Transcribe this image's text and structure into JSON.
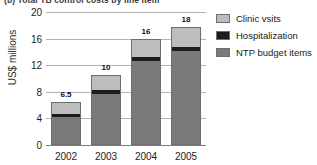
{
  "caption": "(b) Total TB control costs by line item",
  "chart_data": {
    "type": "bar",
    "stacked": true,
    "title": "(b) Total TB control costs by line item",
    "xlabel": "",
    "ylabel": "US$ millions",
    "ylim": [
      0,
      20
    ],
    "yticks": [
      0,
      4,
      8,
      12,
      16,
      20
    ],
    "ytick_labels": [
      "0",
      "4",
      "8",
      "12",
      "16",
      "20"
    ],
    "grid": "horizontal",
    "legend_position": "top-right",
    "categories": [
      "2002",
      "2003",
      "2004",
      "2005"
    ],
    "series": [
      {
        "name": "NTP budget items",
        "color": "#7a7a7a",
        "values": [
          4.2,
          7.7,
          12.7,
          14.2
        ]
      },
      {
        "name": "Hospitalization",
        "color": "#1c1c1c",
        "values": [
          0.5,
          0.6,
          0.7,
          0.7
        ]
      },
      {
        "name": "Clinic vsits",
        "color": "#bdbdbd",
        "values": [
          1.8,
          2.2,
          2.5,
          2.8
        ]
      }
    ],
    "totals": [
      6.5,
      10.5,
      15.9,
      17.7
    ],
    "total_labels": [
      "6.5",
      "10",
      "16",
      "18"
    ]
  },
  "legend": {
    "items": [
      {
        "label": "Clinic vsits",
        "color": "#bdbdbd"
      },
      {
        "label": "Hospitalization",
        "color": "#1c1c1c"
      },
      {
        "label": "NTP budget items",
        "color": "#7a7a7a"
      }
    ]
  }
}
